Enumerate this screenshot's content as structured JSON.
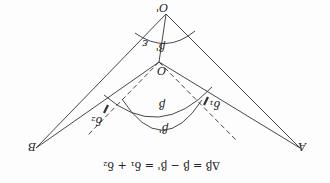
{
  "orientation": "rotated 180 degrees",
  "labels": {
    "o_prime": "O'",
    "o": "O",
    "a": "A",
    "b": "B",
    "beta": "β",
    "beta_prime_top": "β'",
    "beta_prime_bottom": "β'",
    "epsilon": "ε",
    "delta1": "δ₁",
    "delta2": "δ₂"
  },
  "equation": "Δβ = β − β' = δ₁ + δ₂",
  "colors": {
    "line": "#333333",
    "background": "#fdfdfd"
  }
}
